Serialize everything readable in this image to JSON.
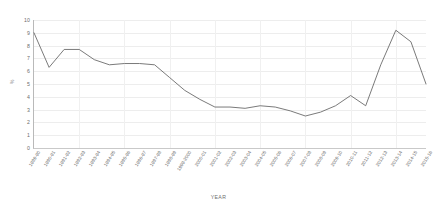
{
  "chart_data": {
    "type": "line",
    "title": "",
    "xlabel": "YEAR",
    "ylabel": "%",
    "ylim": [
      0,
      10
    ],
    "ytick_step": 1,
    "grid": true,
    "legend": "none",
    "line_color": "#6b6b6b",
    "categories": [
      "1989-90",
      "1990-91",
      "1991-92",
      "1992-93",
      "1993-94",
      "1994-95",
      "1995-96",
      "1996-97",
      "1997-98",
      "1998-99",
      "1999-2000",
      "2000-01",
      "2001-02",
      "2002-03",
      "2003-04",
      "2004-05",
      "2005-06",
      "2006-07",
      "2007-08",
      "2008-09",
      "2009-10",
      "2010-11",
      "2011-12",
      "2012-13",
      "2013-14",
      "2014-15",
      "2015-16"
    ],
    "ytick_labels": [
      "10",
      "9",
      "8",
      "7",
      "6",
      "5",
      "4",
      "3",
      "2",
      "1",
      "0"
    ],
    "values": [
      9.0,
      6.3,
      7.7,
      7.7,
      6.9,
      6.5,
      6.6,
      6.6,
      6.5,
      5.5,
      4.5,
      3.8,
      3.2,
      3.2,
      3.1,
      3.3,
      3.2,
      2.9,
      2.5,
      2.8,
      3.3,
      4.1,
      3.3,
      6.5,
      9.2,
      8.3,
      5.0
    ]
  },
  "chart_meta": {
    "axis_line_color": "#b9b9b9",
    "grid_color": "#ededed",
    "background": "#ffffff"
  }
}
